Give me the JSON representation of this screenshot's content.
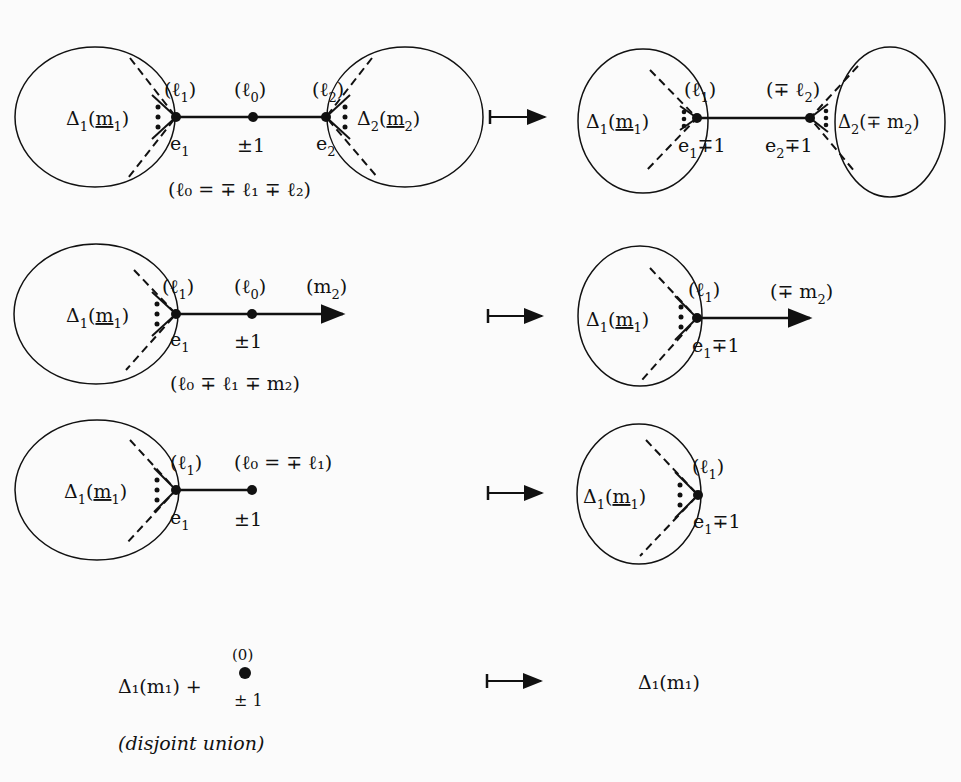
{
  "rows": [
    {
      "left": {
        "blob1": {
          "delta": "Δ",
          "sub": "1",
          "arg": "m",
          "argsub": "1"
        },
        "blob2": {
          "delta": "Δ",
          "sub": "2",
          "arg": "m",
          "argsub": "2"
        },
        "labels": {
          "l1": "(ℓ",
          "l1sub": "1",
          "l1close": ")",
          "l0": "(ℓ",
          "l0sub": "0",
          "l0close": ")",
          "l2": "(ℓ",
          "l2sub": "2",
          "l2close": ")",
          "e1": "e",
          "e1sub": "1",
          "pm": "±1",
          "e2": "e",
          "e2sub": "2",
          "relation": "(ℓ₀ = ∓ ℓ₁ ∓ ℓ₂)"
        }
      },
      "right": {
        "blob1": {
          "delta": "Δ",
          "sub": "1",
          "arg": "m",
          "argsub": "1"
        },
        "blob2": {
          "delta": "Δ",
          "sub": "2",
          "arg": "(∓ m",
          "argsub": "2"
        },
        "labels": {
          "l1": "(ℓ",
          "l1sub": "1",
          "l1close": ")",
          "l2": "(∓ ℓ",
          "l2sub": "2",
          "l2close": ")",
          "e1": "e",
          "e1sub": "1",
          "e1tail": "∓1",
          "e2": "e",
          "e2sub": "2",
          "e2tail": "∓1"
        }
      }
    },
    {
      "left": {
        "blob1": {
          "delta": "Δ",
          "sub": "1",
          "arg": "m",
          "argsub": "1"
        },
        "labels": {
          "l1": "(ℓ",
          "l1sub": "1",
          "l1close": ")",
          "l0": "(ℓ",
          "l0sub": "0",
          "l0close": ")",
          "m2": "(m",
          "m2sub": "2",
          "m2close": ")",
          "e1": "e",
          "e1sub": "1",
          "pm": "±1",
          "relation": "(ℓ₀ ∓ ℓ₁ ∓ m₂)"
        }
      },
      "right": {
        "blob1": {
          "delta": "Δ",
          "sub": "1",
          "arg": "m",
          "argsub": "1"
        },
        "labels": {
          "l1": "(ℓ",
          "l1sub": "1",
          "l1close": ")",
          "m2": "(∓ m",
          "m2sub": "2",
          "m2close": ")",
          "e1": "e",
          "e1sub": "1",
          "e1tail": "∓1"
        }
      }
    },
    {
      "left": {
        "blob1": {
          "delta": "Δ",
          "sub": "1",
          "arg": "m",
          "argsub": "1"
        },
        "labels": {
          "l1": "(ℓ",
          "l1sub": "1",
          "l1close": ")",
          "l0rel": "(ℓ₀ = ∓ ℓ₁)",
          "e1": "e",
          "e1sub": "1",
          "pm": "±1"
        }
      },
      "right": {
        "blob1": {
          "delta": "Δ",
          "sub": "1",
          "arg": "m",
          "argsub": "1"
        },
        "labels": {
          "l1": "(ℓ",
          "l1sub": "1",
          "l1close": ")",
          "e1": "e",
          "e1sub": "1",
          "e1tail": "∓1"
        }
      }
    },
    {
      "left": {
        "expr": "Δ₁(m₁) +",
        "vertex_top": "(0)",
        "vertex_bottom": "± 1",
        "note": "(disjoint union)"
      },
      "right": {
        "expr": "Δ₁(m₁)"
      }
    }
  ],
  "maps_to_symbol": "↦"
}
